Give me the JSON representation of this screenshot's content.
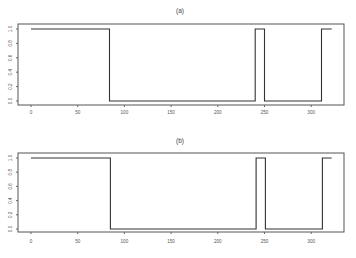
{
  "chart_data": [
    {
      "type": "line",
      "title": "(a)",
      "xlabel": "",
      "ylabel": "",
      "xlim": [
        -10,
        340
      ],
      "ylim": [
        0,
        1
      ],
      "x_ticks": [
        0,
        50,
        100,
        150,
        200,
        250,
        300
      ],
      "y_ticks": [
        "0.0",
        "0.2",
        "0.4",
        "0.6",
        "0.8",
        "1.0"
      ],
      "grid": false,
      "legend": null,
      "series": [
        {
          "name": "step signal (a)",
          "x": [
            0,
            84,
            84,
            240,
            240,
            250,
            250,
            311,
            311,
            322
          ],
          "y": [
            1,
            1,
            0,
            0,
            1,
            1,
            0,
            0,
            1,
            1
          ]
        }
      ]
    },
    {
      "type": "line",
      "title": "(b)",
      "xlabel": "",
      "ylabel": "",
      "xlim": [
        -10,
        340
      ],
      "ylim": [
        0,
        1
      ],
      "x_ticks": [
        0,
        50,
        100,
        150,
        200,
        250,
        300
      ],
      "y_ticks": [
        "0.0",
        "0.2",
        "0.4",
        "0.6",
        "0.8",
        "1.0"
      ],
      "grid": false,
      "legend": null,
      "series": [
        {
          "name": "step signal (b)",
          "x": [
            0,
            85,
            85,
            241,
            241,
            251,
            251,
            312,
            312,
            322
          ],
          "y": [
            1,
            1,
            0,
            0,
            1,
            1,
            0,
            0,
            1,
            1
          ]
        }
      ]
    }
  ],
  "panels": [
    {
      "title": "(a)"
    },
    {
      "title": "(b)"
    }
  ]
}
